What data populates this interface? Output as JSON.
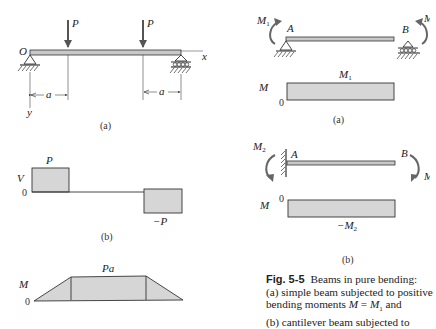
{
  "colors": {
    "ink": "#333333",
    "fill": "#d6d6d6",
    "beam": "#c8c8c8"
  },
  "left_panel": {
    "a": {
      "origin_label": "O",
      "x_axis_label": "x",
      "y_axis_label": "y",
      "load_1_label": "P",
      "load_2_label": "P",
      "dim_left_label": "a",
      "dim_right_label": "a",
      "sublabel": "(a)"
    },
    "b": {
      "axis_label": "V",
      "zero_label": "0",
      "positive_label": "P",
      "negative_label": "−P",
      "sublabel": "(b)"
    },
    "c": {
      "axis_label": "M",
      "zero_label": "0",
      "peak_label": "Pa"
    }
  },
  "right_panel": {
    "a": {
      "moment_left_label": "M",
      "moment_left_sub": "1",
      "moment_right_label": "M",
      "point_a_label": "A",
      "point_b_label": "B",
      "axis_label": "M",
      "zero_label": "0",
      "value_label": "M",
      "value_sub": "1",
      "sublabel": "(a)"
    },
    "b": {
      "moment_left_label": "M",
      "moment_left_sub": "2",
      "moment_right_label": "M",
      "point_a_label": "A",
      "point_b_label": "B",
      "axis_label": "M",
      "zero_label": "0",
      "value_label": "−M",
      "value_sub": "2",
      "sublabel": "(b)"
    }
  },
  "caption": {
    "fig_label": "Fig. 5-5",
    "line1": "Beams in pure bending:",
    "line2": "(a) simple beam subjected to positive",
    "line3_pre": "bending moments ",
    "line3_math_lhs": "M",
    "line3_eq": " = ",
    "line3_math_rhs": "M",
    "line3_sub": "1",
    "line3_post": " and",
    "line4": "(b) cantilever beam subjected to"
  }
}
